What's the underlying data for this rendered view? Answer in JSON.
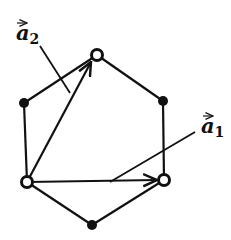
{
  "diagram": {
    "title": "",
    "vectors": [
      {
        "id": "a2",
        "symbol": "a",
        "subscript": "2",
        "label": "a2"
      },
      {
        "id": "a1",
        "symbol": "a",
        "subscript": "1",
        "label": "a1"
      }
    ],
    "vertex_types": {
      "open": "open-circle",
      "filled": "filled-circle"
    },
    "colors": {
      "ink": "#111111",
      "background": "#ffffff"
    }
  }
}
